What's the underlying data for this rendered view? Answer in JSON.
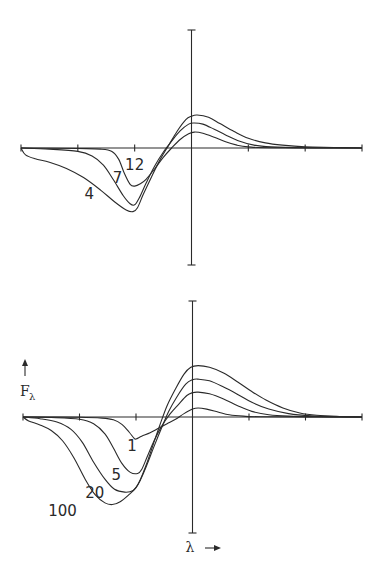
{
  "chart_data": [
    {
      "type": "line",
      "title": "",
      "xlabel": "",
      "ylabel": "",
      "xlim": [
        -3,
        3
      ],
      "ylim": [
        -2.05,
        2.05
      ],
      "xticks": [
        -3,
        -2,
        -1,
        0,
        1,
        2,
        3
      ],
      "grid": false,
      "series": [
        {
          "name": "4",
          "label": "4",
          "points": [
            [
              -3.0,
              0.0
            ],
            [
              -2.92,
              -0.12
            ],
            [
              -2.75,
              -0.19
            ],
            [
              -2.5,
              -0.25
            ],
            [
              -2.2,
              -0.36
            ],
            [
              -1.9,
              -0.52
            ],
            [
              -1.6,
              -0.74
            ],
            [
              -1.35,
              -0.95
            ],
            [
              -1.15,
              -1.09
            ],
            [
              -1.03,
              -1.12
            ],
            [
              -0.95,
              -1.05
            ],
            [
              -0.85,
              -0.82
            ],
            [
              -0.7,
              -0.5
            ],
            [
              -0.55,
              -0.2
            ],
            [
              -0.4,
              0.05
            ],
            [
              -0.25,
              0.3
            ],
            [
              -0.1,
              0.5
            ],
            [
              0.0,
              0.56
            ],
            [
              0.1,
              0.58
            ],
            [
              0.3,
              0.54
            ],
            [
              0.5,
              0.43
            ],
            [
              0.75,
              0.29
            ],
            [
              1.0,
              0.17
            ],
            [
              1.3,
              0.09
            ],
            [
              1.6,
              0.05
            ],
            [
              2.0,
              0.02
            ],
            [
              2.5,
              0.01
            ],
            [
              3.0,
              0.0
            ]
          ]
        },
        {
          "name": "7",
          "label": "7",
          "points": [
            [
              -3.0,
              0.0
            ],
            [
              -2.5,
              -0.02
            ],
            [
              -2.0,
              -0.06
            ],
            [
              -1.75,
              -0.14
            ],
            [
              -1.55,
              -0.3
            ],
            [
              -1.38,
              -0.55
            ],
            [
              -1.2,
              -0.84
            ],
            [
              -1.08,
              -0.98
            ],
            [
              -1.0,
              -1.0
            ],
            [
              -0.92,
              -0.88
            ],
            [
              -0.8,
              -0.62
            ],
            [
              -0.65,
              -0.32
            ],
            [
              -0.5,
              -0.08
            ],
            [
              -0.35,
              0.12
            ],
            [
              -0.2,
              0.3
            ],
            [
              -0.05,
              0.42
            ],
            [
              0.05,
              0.44
            ],
            [
              0.2,
              0.42
            ],
            [
              0.4,
              0.33
            ],
            [
              0.6,
              0.23
            ],
            [
              0.85,
              0.12
            ],
            [
              1.1,
              0.05
            ],
            [
              1.4,
              0.02
            ],
            [
              2.0,
              0.005
            ],
            [
              3.0,
              0.0
            ]
          ]
        },
        {
          "name": "12",
          "label": "12",
          "points": [
            [
              -3.0,
              0.0
            ],
            [
              -2.0,
              -0.01
            ],
            [
              -1.6,
              -0.02
            ],
            [
              -1.4,
              -0.06
            ],
            [
              -1.28,
              -0.2
            ],
            [
              -1.18,
              -0.45
            ],
            [
              -1.08,
              -0.64
            ],
            [
              -1.0,
              -0.67
            ],
            [
              -0.9,
              -0.63
            ],
            [
              -0.8,
              -0.55
            ],
            [
              -0.65,
              -0.37
            ],
            [
              -0.5,
              -0.17
            ],
            [
              -0.35,
              0.0
            ],
            [
              -0.2,
              0.15
            ],
            [
              -0.05,
              0.25
            ],
            [
              0.05,
              0.28
            ],
            [
              0.2,
              0.26
            ],
            [
              0.4,
              0.19
            ],
            [
              0.6,
              0.11
            ],
            [
              0.8,
              0.05
            ],
            [
              1.0,
              0.02
            ],
            [
              1.4,
              0.005
            ],
            [
              3.0,
              0.0
            ]
          ]
        }
      ],
      "annotations": [
        {
          "text": "4",
          "x": -1.8,
          "y": -0.9
        },
        {
          "text": "7",
          "x": -1.3,
          "y": -0.62
        },
        {
          "text": "12",
          "x": -1.0,
          "y": -0.38
        }
      ]
    },
    {
      "type": "line",
      "title": "",
      "xlabel": "λ →",
      "ylabel": "↑ F_λ",
      "xlim": [
        -3,
        3
      ],
      "ylim": [
        -2.05,
        2.05
      ],
      "xticks": [
        -3,
        -2,
        -1,
        0,
        1,
        2,
        3
      ],
      "grid": false,
      "series": [
        {
          "name": "1",
          "label": "1",
          "points": [
            [
              -3.0,
              0.0
            ],
            [
              -2.0,
              -0.005
            ],
            [
              -1.6,
              -0.02
            ],
            [
              -1.4,
              -0.05
            ],
            [
              -1.25,
              -0.13
            ],
            [
              -1.12,
              -0.27
            ],
            [
              -1.04,
              -0.37
            ],
            [
              -1.0,
              -0.39
            ],
            [
              -0.9,
              -0.34
            ],
            [
              -0.75,
              -0.28
            ],
            [
              -0.6,
              -0.2
            ],
            [
              -0.45,
              -0.12
            ],
            [
              -0.3,
              -0.04
            ],
            [
              -0.15,
              0.06
            ],
            [
              0.0,
              0.14
            ],
            [
              0.1,
              0.16
            ],
            [
              0.25,
              0.14
            ],
            [
              0.45,
              0.09
            ],
            [
              0.65,
              0.04
            ],
            [
              0.9,
              0.015
            ],
            [
              1.2,
              0.005
            ],
            [
              3.0,
              0.0
            ]
          ]
        },
        {
          "name": "5",
          "label": "5",
          "points": [
            [
              -3.0,
              0.0
            ],
            [
              -2.5,
              -0.01
            ],
            [
              -2.0,
              -0.04
            ],
            [
              -1.75,
              -0.12
            ],
            [
              -1.55,
              -0.3
            ],
            [
              -1.4,
              -0.55
            ],
            [
              -1.25,
              -0.82
            ],
            [
              -1.1,
              -0.98
            ],
            [
              -0.97,
              -1.0
            ],
            [
              -0.9,
              -0.93
            ],
            [
              -0.8,
              -0.7
            ],
            [
              -0.68,
              -0.42
            ],
            [
              -0.55,
              -0.17
            ],
            [
              -0.4,
              0.05
            ],
            [
              -0.25,
              0.22
            ],
            [
              -0.1,
              0.38
            ],
            [
              0.0,
              0.43
            ],
            [
              0.1,
              0.44
            ],
            [
              0.3,
              0.41
            ],
            [
              0.55,
              0.32
            ],
            [
              0.8,
              0.2
            ],
            [
              1.05,
              0.1
            ],
            [
              1.35,
              0.04
            ],
            [
              1.7,
              0.015
            ],
            [
              2.2,
              0.005
            ],
            [
              3.0,
              0.0
            ]
          ]
        },
        {
          "name": "20",
          "label": "20",
          "points": [
            [
              -3.0,
              0.0
            ],
            [
              -2.7,
              -0.03
            ],
            [
              -2.4,
              -0.09
            ],
            [
              -2.15,
              -0.22
            ],
            [
              -1.95,
              -0.45
            ],
            [
              -1.75,
              -0.8
            ],
            [
              -1.55,
              -1.1
            ],
            [
              -1.38,
              -1.28
            ],
            [
              -1.2,
              -1.33
            ],
            [
              -1.05,
              -1.3
            ],
            [
              -0.95,
              -1.17
            ],
            [
              -0.82,
              -0.88
            ],
            [
              -0.68,
              -0.52
            ],
            [
              -0.55,
              -0.2
            ],
            [
              -0.42,
              0.1
            ],
            [
              -0.28,
              0.35
            ],
            [
              -0.12,
              0.58
            ],
            [
              0.0,
              0.66
            ],
            [
              0.1,
              0.67
            ],
            [
              0.3,
              0.64
            ],
            [
              0.55,
              0.53
            ],
            [
              0.8,
              0.4
            ],
            [
              1.05,
              0.26
            ],
            [
              1.35,
              0.14
            ],
            [
              1.7,
              0.06
            ],
            [
              2.1,
              0.02
            ],
            [
              2.6,
              0.005
            ],
            [
              3.0,
              0.0
            ]
          ]
        },
        {
          "name": "100",
          "label": "100",
          "points": [
            [
              -3.0,
              0.0
            ],
            [
              -2.9,
              -0.07
            ],
            [
              -2.7,
              -0.14
            ],
            [
              -2.5,
              -0.24
            ],
            [
              -2.3,
              -0.42
            ],
            [
              -2.1,
              -0.72
            ],
            [
              -1.9,
              -1.1
            ],
            [
              -1.72,
              -1.38
            ],
            [
              -1.55,
              -1.52
            ],
            [
              -1.42,
              -1.55
            ],
            [
              -1.28,
              -1.5
            ],
            [
              -1.12,
              -1.37
            ],
            [
              -1.0,
              -1.25
            ],
            [
              -0.92,
              -1.1
            ],
            [
              -0.82,
              -0.85
            ],
            [
              -0.7,
              -0.5
            ],
            [
              -0.58,
              -0.15
            ],
            [
              -0.45,
              0.2
            ],
            [
              -0.3,
              0.5
            ],
            [
              -0.15,
              0.76
            ],
            [
              -0.03,
              0.88
            ],
            [
              0.1,
              0.91
            ],
            [
              0.3,
              0.88
            ],
            [
              0.55,
              0.78
            ],
            [
              0.8,
              0.62
            ],
            [
              1.05,
              0.45
            ],
            [
              1.3,
              0.3
            ],
            [
              1.6,
              0.16
            ],
            [
              1.9,
              0.07
            ],
            [
              2.2,
              0.03
            ],
            [
              2.6,
              0.01
            ],
            [
              3.0,
              0.0
            ]
          ]
        }
      ],
      "annotations": [
        {
          "text": "1",
          "x": -1.07,
          "y": -0.6
        },
        {
          "text": "5",
          "x": -1.35,
          "y": -1.12
        },
        {
          "text": "20",
          "x": -1.73,
          "y": -1.43
        },
        {
          "text": "100",
          "x": -2.3,
          "y": -1.75
        }
      ]
    }
  ]
}
